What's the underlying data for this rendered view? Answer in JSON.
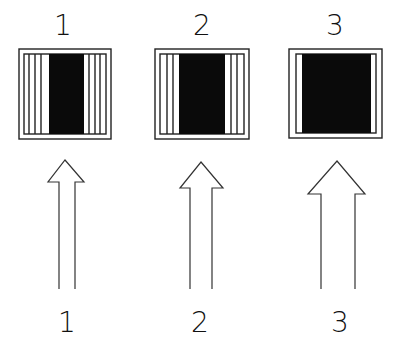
{
  "diagram": {
    "top_labels": [
      "1",
      "2",
      "3"
    ],
    "bottom_labels": [
      "1",
      "2",
      "3"
    ],
    "panels": [
      {
        "id": 1,
        "label": "1",
        "outer": [
          19,
          49,
          92,
          90
        ],
        "inner": [
          24,
          54,
          82,
          80
        ],
        "black": [
          49,
          54,
          35,
          80
        ],
        "lines_left": [
          29,
          35,
          41
        ],
        "lines_right": [
          89,
          95,
          100
        ]
      },
      {
        "id": 2,
        "label": "2",
        "outer": [
          155,
          49,
          94,
          90
        ],
        "inner": [
          160,
          54,
          84,
          80
        ],
        "black": [
          179,
          54,
          46,
          80
        ],
        "lines_left": [
          167,
          173
        ],
        "lines_right": [
          231,
          237
        ]
      },
      {
        "id": 3,
        "label": "3",
        "outer": [
          289,
          49,
          93,
          89
        ],
        "inner": [
          296,
          54,
          80,
          79
        ],
        "black": [
          302,
          54,
          69,
          79
        ],
        "lines_left": [],
        "lines_right": []
      }
    ],
    "arrows": [
      {
        "id": 1,
        "label": "1",
        "tip": [
          65,
          160
        ],
        "head_base_y": 182,
        "head_x": [
          48,
          84
        ],
        "shaft_x": [
          59,
          75
        ],
        "bottom_y": 290
      },
      {
        "id": 2,
        "label": "2",
        "tip": [
          201,
          162
        ],
        "head_base_y": 188,
        "head_x": [
          180,
          223
        ],
        "shaft_x": [
          190,
          212
        ],
        "bottom_y": 290
      },
      {
        "id": 3,
        "label": "3",
        "tip": [
          337,
          161
        ],
        "head_base_y": 194,
        "head_x": [
          308,
          365
        ],
        "shaft_x": [
          321,
          355
        ],
        "bottom_y": 290
      }
    ],
    "colors": {
      "line": "#222222",
      "fill": "#0a0a0a",
      "background": "#ffffff"
    }
  }
}
